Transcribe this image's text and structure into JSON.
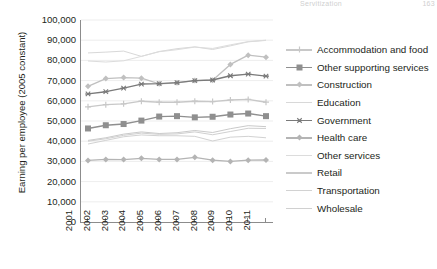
{
  "running_head": {
    "title": "Servitization",
    "page": "163"
  },
  "axes": {
    "ylabel": "Earning per employee (2005 constant)",
    "yticks": [
      "100,000",
      "90,000",
      "80,000",
      "70,000",
      "60,000",
      "50,000",
      "40,000",
      "30,000",
      "20,000",
      "10,000",
      "0"
    ],
    "xticks": [
      "2001",
      "2002",
      "2003",
      "2004",
      "2005",
      "2006",
      "2007",
      "2008",
      "2009",
      "2010",
      "2011"
    ]
  },
  "legend": {
    "items": [
      {
        "label": "Accommodation and food",
        "color": "#c8c8c8",
        "marker": "plus"
      },
      {
        "label": "Other supporting services",
        "color": "#8f8f8f",
        "marker": "square"
      },
      {
        "label": "Construction",
        "color": "#c0c0c0",
        "marker": "diamond"
      },
      {
        "label": "Education",
        "color": "#d8d8d8",
        "marker": "none"
      },
      {
        "label": "Government",
        "color": "#7a7a7a",
        "marker": "star"
      },
      {
        "label": "Health care",
        "color": "#b4b4b4",
        "marker": "diamond"
      },
      {
        "label": "Other services",
        "color": "#dcdcdc",
        "marker": "none"
      },
      {
        "label": "Retail",
        "color": "#cacaca",
        "marker": "none"
      },
      {
        "label": "Transportation",
        "color": "#d2d2d2",
        "marker": "none"
      },
      {
        "label": "Wholesale",
        "color": "#d0d0d0",
        "marker": "none"
      }
    ]
  },
  "chart_data": {
    "type": "line",
    "title": "",
    "xlabel": "",
    "ylabel": "Earning per employee (2005 constant)",
    "x": [
      "2001",
      "2002",
      "2003",
      "2004",
      "2005",
      "2006",
      "2007",
      "2008",
      "2009",
      "2010",
      "2011"
    ],
    "ylim": [
      0,
      100000
    ],
    "ytick_step": 10000,
    "grid": true,
    "legend_position": "right",
    "series": [
      {
        "name": "Accommodation and food",
        "color": "#c8c8c8",
        "marker": "plus",
        "values": [
          57000,
          58100,
          58500,
          59800,
          59300,
          59300,
          59800,
          59600,
          60400,
          60700,
          59300
        ]
      },
      {
        "name": "Other supporting services",
        "color": "#8f8f8f",
        "marker": "square",
        "values": [
          46300,
          47900,
          48500,
          50200,
          52200,
          52400,
          51800,
          52100,
          53200,
          53700,
          52400
        ]
      },
      {
        "name": "Construction",
        "color": "#c0c0c0",
        "marker": "diamond",
        "values": [
          67200,
          71000,
          71500,
          71200,
          68400,
          68900,
          70000,
          70200,
          78000,
          82600,
          81600
        ]
      },
      {
        "name": "Education",
        "color": "#d8d8d8",
        "marker": "none",
        "values": [
          83700,
          84100,
          84600,
          82000,
          84400,
          85800,
          86700,
          85400,
          87200,
          89200,
          89900
        ]
      },
      {
        "name": "Government",
        "color": "#7a7a7a",
        "marker": "star",
        "values": [
          63400,
          64500,
          66300,
          68300,
          68500,
          69000,
          70000,
          70300,
          72400,
          73200,
          72200
        ]
      },
      {
        "name": "Health care",
        "color": "#b4b4b4",
        "marker": "diamond",
        "values": [
          30500,
          31000,
          30900,
          31500,
          31000,
          31000,
          32000,
          30600,
          30000,
          30600,
          30700
        ]
      },
      {
        "name": "Other services",
        "color": "#dcdcdc",
        "marker": "none",
        "values": [
          79700,
          79200,
          79800,
          82000,
          84300,
          85300,
          86600,
          85900,
          87700,
          89300,
          90000
        ]
      },
      {
        "name": "Retail",
        "color": "#cacaca",
        "marker": "none",
        "values": [
          40400,
          41700,
          43500,
          44600,
          43800,
          44200,
          45300,
          44300,
          46200,
          47700,
          47200
        ]
      },
      {
        "name": "Transportation",
        "color": "#d2d2d2",
        "marker": "none",
        "values": [
          38600,
          40400,
          42200,
          43100,
          42700,
          42700,
          42400,
          40100,
          42000,
          42400,
          41700
        ]
      },
      {
        "name": "Wholesale",
        "color": "#d0d0d0",
        "marker": "none",
        "values": [
          40000,
          41200,
          42900,
          44000,
          43400,
          43600,
          44600,
          43200,
          44800,
          46400,
          46300
        ]
      }
    ]
  }
}
